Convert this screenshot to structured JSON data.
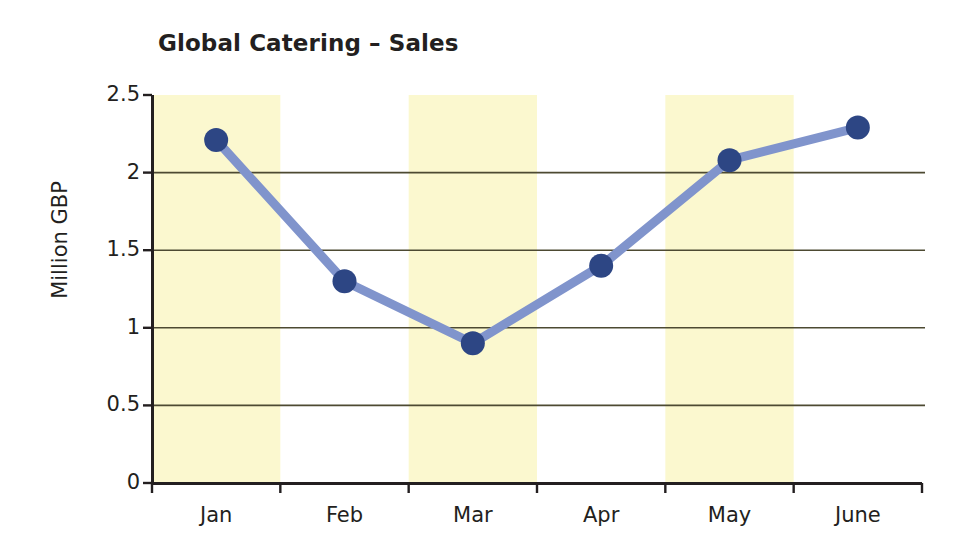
{
  "chart_data": {
    "type": "line",
    "title": "Global Catering – Sales",
    "xlabel": "",
    "ylabel": "Million GBP",
    "categories": [
      "Jan",
      "Feb",
      "Mar",
      "Apr",
      "May",
      "June"
    ],
    "values": [
      2.21,
      1.3,
      0.9,
      1.4,
      2.08,
      2.29
    ],
    "series": [
      {
        "name": "Sales",
        "values": [
          2.21,
          1.3,
          0.9,
          1.4,
          2.08,
          2.29
        ]
      }
    ],
    "ylim": [
      0,
      2.5
    ],
    "ytick_labels": [
      "0",
      "0.5",
      "1",
      "1.5",
      "2",
      "2.5"
    ],
    "ytick_values": [
      0,
      0.5,
      1,
      1.5,
      2,
      2.5
    ],
    "grid": "horizontal",
    "legend": "none",
    "banding": {
      "description": "alternating pale-yellow vertical bands behind Jan, Mar and May",
      "highlighted_categories": [
        "Jan",
        "Mar",
        "May"
      ]
    },
    "colors": {
      "line": "#8094cc",
      "marker": "#2d4684",
      "band": "#fbf8cf",
      "grid": "#4d4a32",
      "axis": "#231f20",
      "text": "#231f20",
      "background": "#ffffff"
    },
    "marker_style": "filled-circle",
    "line_width_px": 9,
    "marker_radius_px": 12
  }
}
